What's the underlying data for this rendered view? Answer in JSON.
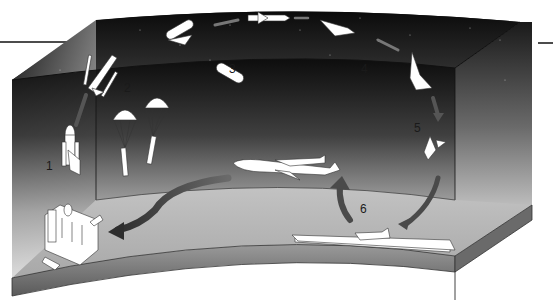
{
  "figure": {
    "style": "grayscale illustration",
    "colors": {
      "sky_dark": "#0d0d0d",
      "sky_light": "#e8e8e8",
      "ground": "#b4b4b4",
      "ground_edge": "#7a7a7a",
      "arrow": "#4a4a4a",
      "craft": "#ffffff"
    }
  },
  "stages": [
    {
      "number": "1",
      "label": "1",
      "description": "launch-pad liftoff"
    },
    {
      "number": "2",
      "label": "2",
      "description": "solid rocket booster separation and parachute recovery"
    },
    {
      "number": "3",
      "label": "3",
      "description": "external tank separation"
    },
    {
      "number": "4",
      "label": "4",
      "description": "orbit"
    },
    {
      "number": "5",
      "label": "5",
      "description": "reentry and descent"
    },
    {
      "number": "6",
      "label": "6",
      "description": "runway landing and ferry flight back"
    }
  ]
}
